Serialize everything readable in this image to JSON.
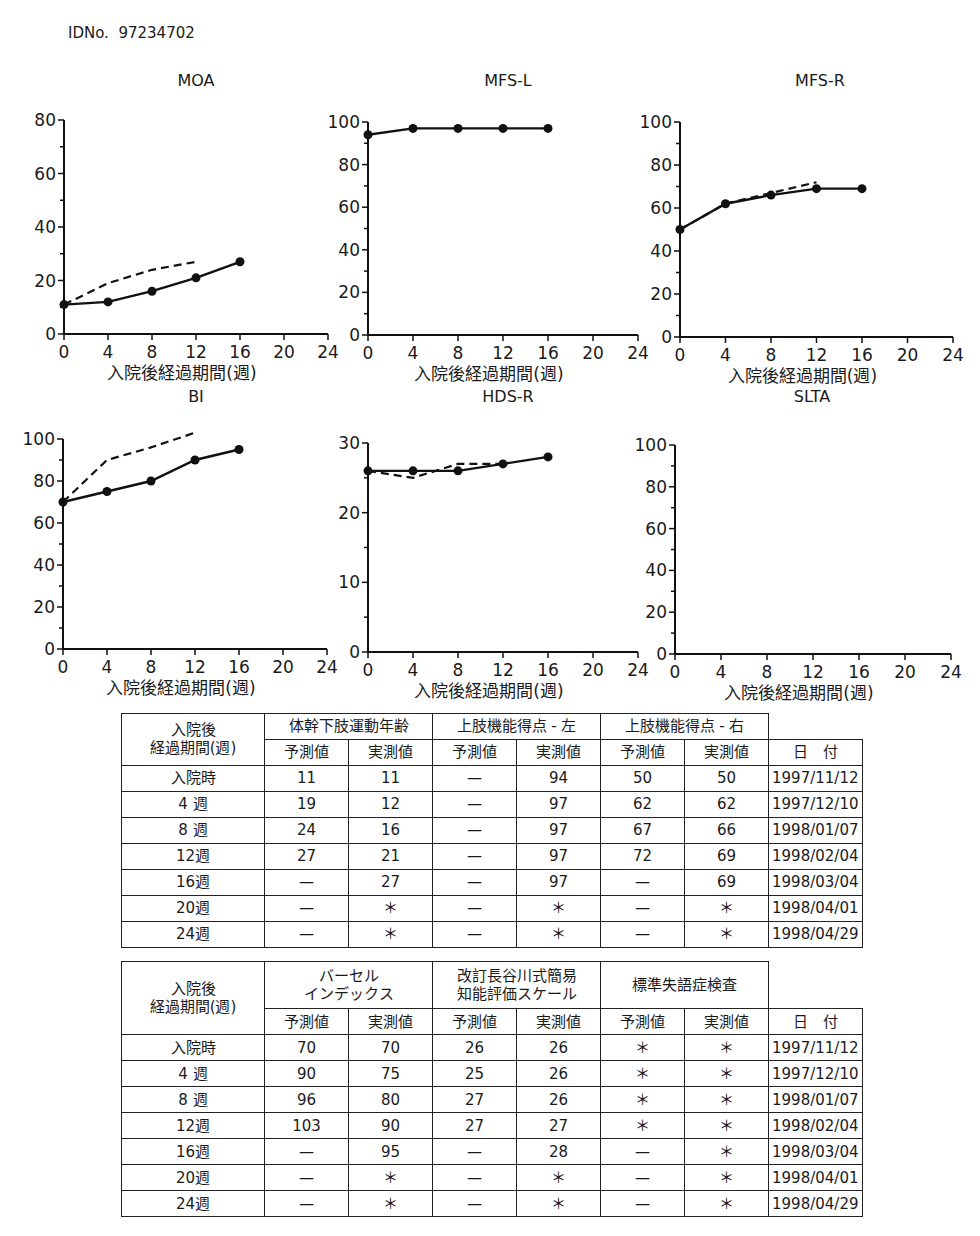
{
  "header": {
    "id_label": "IDNo.",
    "id_value": "97234702"
  },
  "xlabel": "入院後経過期間(週)",
  "x_ticks": [
    0,
    4,
    8,
    12,
    16,
    20,
    24
  ],
  "chart_data": [
    {
      "type": "line",
      "title": "MOA",
      "xlabel": "入院後経過期間(週)",
      "ylabel": "",
      "ylim": [
        0,
        80
      ],
      "y_ticks": [
        0,
        20,
        40,
        60,
        80
      ],
      "xlim": [
        0,
        24
      ],
      "series": [
        {
          "name": "予測値",
          "style": "dashed",
          "x": [
            0,
            4,
            8,
            12
          ],
          "values": [
            11,
            19,
            24,
            27
          ]
        },
        {
          "name": "実測値",
          "style": "solid-markers",
          "x": [
            0,
            4,
            8,
            12,
            16
          ],
          "values": [
            11,
            12,
            16,
            21,
            27
          ]
        }
      ]
    },
    {
      "type": "line",
      "title": "MFS-L",
      "xlabel": "入院後経過期間(週)",
      "ylabel": "",
      "ylim": [
        0,
        100
      ],
      "y_ticks": [
        0,
        20,
        40,
        60,
        80,
        100
      ],
      "xlim": [
        0,
        24
      ],
      "series": [
        {
          "name": "実測値",
          "style": "solid-markers",
          "x": [
            0,
            4,
            8,
            12,
            16
          ],
          "values": [
            94,
            97,
            97,
            97,
            97
          ]
        }
      ]
    },
    {
      "type": "line",
      "title": "MFS-R",
      "xlabel": "入院後経過期間(週)",
      "ylabel": "",
      "ylim": [
        0,
        100
      ],
      "y_ticks": [
        0,
        20,
        40,
        60,
        80,
        100
      ],
      "xlim": [
        0,
        24
      ],
      "series": [
        {
          "name": "予測値",
          "style": "dashed",
          "x": [
            0,
            4,
            8,
            12
          ],
          "values": [
            50,
            62,
            67,
            72
          ]
        },
        {
          "name": "実測値",
          "style": "solid-markers",
          "x": [
            0,
            4,
            8,
            12,
            16
          ],
          "values": [
            50,
            62,
            66,
            69,
            69
          ]
        }
      ]
    },
    {
      "type": "line",
      "title": "BI",
      "xlabel": "入院後経過期間(週)",
      "ylabel": "",
      "ylim": [
        0,
        100
      ],
      "y_ticks": [
        0,
        20,
        40,
        60,
        80,
        100
      ],
      "xlim": [
        0,
        24
      ],
      "series": [
        {
          "name": "予測値",
          "style": "dashed",
          "x": [
            0,
            4,
            8,
            12
          ],
          "values": [
            70,
            90,
            96,
            103
          ]
        },
        {
          "name": "実測値",
          "style": "solid-markers",
          "x": [
            0,
            4,
            8,
            12,
            16
          ],
          "values": [
            70,
            75,
            80,
            90,
            95
          ]
        }
      ]
    },
    {
      "type": "line",
      "title": "HDS-R",
      "xlabel": "入院後経過期間(週)",
      "ylabel": "",
      "ylim": [
        0,
        30
      ],
      "y_ticks": [
        0,
        10,
        20,
        30
      ],
      "xlim": [
        0,
        24
      ],
      "series": [
        {
          "name": "予測値",
          "style": "dashed",
          "x": [
            0,
            4,
            8,
            12
          ],
          "values": [
            26,
            25,
            27,
            27
          ]
        },
        {
          "name": "実測値",
          "style": "solid-markers",
          "x": [
            0,
            4,
            8,
            12,
            16
          ],
          "values": [
            26,
            26,
            26,
            27,
            28
          ]
        }
      ]
    },
    {
      "type": "line",
      "title": "SLTA",
      "xlabel": "入院後経過期間(週)",
      "ylabel": "",
      "ylim": [
        0,
        100
      ],
      "y_ticks": [
        0,
        20,
        40,
        60,
        80,
        100
      ],
      "xlim": [
        0,
        24
      ],
      "series": []
    }
  ],
  "tables": [
    {
      "row_header_top": "入院後",
      "row_header_bottom": "経過期間(週)",
      "groups": [
        "体幹下肢運動年齢",
        "上肢機能得点 - 左",
        "上肢機能得点 - 右"
      ],
      "sub": [
        "予測値",
        "実測値"
      ],
      "date_header": "日　付",
      "rows": [
        [
          "入院時",
          "11",
          "11",
          "—",
          "94",
          "50",
          "50",
          "1997/11/12"
        ],
        [
          "4 週",
          "19",
          "12",
          "—",
          "97",
          "62",
          "62",
          "1997/12/10"
        ],
        [
          "8 週",
          "24",
          "16",
          "—",
          "97",
          "67",
          "66",
          "1998/01/07"
        ],
        [
          "12週",
          "27",
          "21",
          "—",
          "97",
          "72",
          "69",
          "1998/02/04"
        ],
        [
          "16週",
          "—",
          "27",
          "—",
          "97",
          "—",
          "69",
          "1998/03/04"
        ],
        [
          "20週",
          "—",
          "＊",
          "—",
          "＊",
          "—",
          "＊",
          "1998/04/01"
        ],
        [
          "24週",
          "—",
          "＊",
          "—",
          "＊",
          "—",
          "＊",
          "1998/04/29"
        ]
      ]
    },
    {
      "row_header_top": "入院後",
      "row_header_bottom": "経過期間(週)",
      "groups": [
        "バーセル\nインデックス",
        "改訂長谷川式簡易\n知能評価スケール",
        "標準失語症検査"
      ],
      "sub": [
        "予測値",
        "実測値"
      ],
      "date_header": "日　付",
      "rows": [
        [
          "入院時",
          "70",
          "70",
          "26",
          "26",
          "＊",
          "＊",
          "1997/11/12"
        ],
        [
          "4 週",
          "90",
          "75",
          "25",
          "26",
          "＊",
          "＊",
          "1997/12/10"
        ],
        [
          "8 週",
          "96",
          "80",
          "27",
          "26",
          "＊",
          "＊",
          "1998/01/07"
        ],
        [
          "12週",
          "103",
          "90",
          "27",
          "27",
          "＊",
          "＊",
          "1998/02/04"
        ],
        [
          "16週",
          "—",
          "95",
          "—",
          "28",
          "—",
          "＊",
          "1998/03/04"
        ],
        [
          "20週",
          "—",
          "＊",
          "—",
          "＊",
          "—",
          "＊",
          "1998/04/01"
        ],
        [
          "24週",
          "—",
          "＊",
          "—",
          "＊",
          "—",
          "＊",
          "1998/04/29"
        ]
      ]
    }
  ]
}
